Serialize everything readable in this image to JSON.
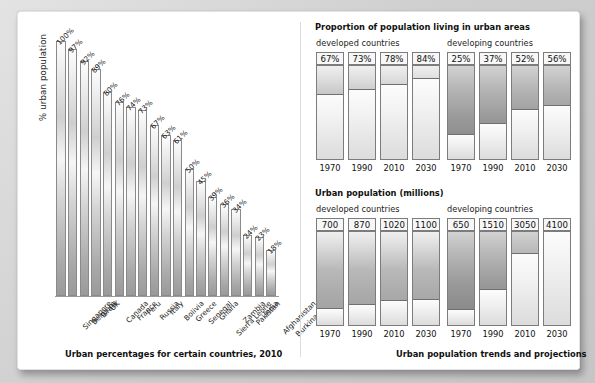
{
  "chart_data": [
    {
      "type": "bar",
      "id": "urban-percentages",
      "title": "Urban percentages for certain countries, 2010",
      "xlabel": "",
      "ylabel": "% urban population",
      "ylim": [
        0,
        100
      ],
      "categories": [
        "Singapore",
        "Belgium",
        "Israel",
        "UK",
        "Canada",
        "France",
        "Peru",
        "Russia",
        "Italy",
        "Bolivia",
        "Greece",
        "Senegal",
        "Ghana",
        "Sierra Leone",
        "Zambia",
        "Pakistan",
        "India",
        "Afghanistan",
        "Burkina Faso"
      ],
      "values": [
        100,
        97,
        92,
        89,
        80,
        76,
        74,
        73,
        67,
        63,
        61,
        50,
        45,
        39,
        36,
        34,
        24,
        23,
        18
      ],
      "value_labels": [
        "100%",
        "97%",
        "92%",
        "89%",
        "80%",
        "76%",
        "74%",
        "73%",
        "67%",
        "63%",
        "61%",
        "50%",
        "45%",
        "39%",
        "36%",
        "34%",
        "24%",
        "23%",
        "18%"
      ]
    },
    {
      "type": "bar",
      "id": "proportion-urban",
      "title": "Proportion of population living in urban areas",
      "unit": "%",
      "groups": [
        {
          "name": "developed countries",
          "categories": [
            "1970",
            "1990",
            "2010",
            "2030"
          ],
          "values": [
            67,
            73,
            78,
            84
          ],
          "value_labels": [
            "67%",
            "73%",
            "78%",
            "84%"
          ]
        },
        {
          "name": "developing countries",
          "categories": [
            "1970",
            "1990",
            "2010",
            "2030"
          ],
          "values": [
            25,
            37,
            52,
            56
          ],
          "value_labels": [
            "25%",
            "37%",
            "52%",
            "56%"
          ]
        }
      ]
    },
    {
      "type": "bar",
      "id": "urban-population-millions",
      "title": "Urban population (millions)",
      "unit": "millions",
      "ylim": [
        0,
        4100
      ],
      "groups": [
        {
          "name": "developed countries",
          "categories": [
            "1970",
            "1990",
            "2010",
            "2030"
          ],
          "values": [
            700,
            870,
            1020,
            1100
          ],
          "value_labels": [
            "700",
            "870",
            "1020",
            "1100"
          ]
        },
        {
          "name": "developing countries",
          "categories": [
            "1970",
            "1990",
            "2010",
            "2030"
          ],
          "values": [
            650,
            1510,
            3050,
            4100
          ],
          "value_labels": [
            "650",
            "1510",
            "3050",
            "4100"
          ]
        }
      ]
    }
  ],
  "left_panel": {
    "ylabel": "% urban population",
    "caption": "Urban percentages for certain countries, 2010"
  },
  "right_panel": {
    "section1_title": "Proportion of population living in urban areas",
    "section2_title": "Urban population (millions)",
    "group_developed": "developed countries",
    "group_developing": "developing countries",
    "caption": "Urban population trends and projections"
  },
  "colors": {
    "panel_background": "#ffffff",
    "page_background": "#d8d8d8",
    "bar_outline": "#8a8a8a",
    "text": "#111111"
  }
}
